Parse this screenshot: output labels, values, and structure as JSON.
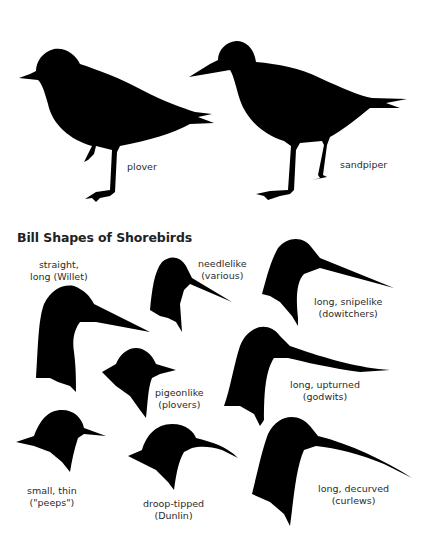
{
  "top_section": {
    "birds": [
      {
        "id": "plover",
        "label": "plover"
      },
      {
        "id": "sandpiper",
        "label": "sandpiper"
      }
    ]
  },
  "bill_section": {
    "title": "Bill Shapes of Shorebirds",
    "bills": [
      {
        "id": "willet",
        "line1": "straight,",
        "line2": "long (Willet)"
      },
      {
        "id": "needlelike",
        "line1": "needlelike",
        "line2": "(various)"
      },
      {
        "id": "snipelike",
        "line1": "long, snipelike",
        "line2": "(dowitchers)"
      },
      {
        "id": "pigeonlike",
        "line1": "pigeonlike",
        "line2": "(plovers)"
      },
      {
        "id": "upturned",
        "line1": "long, upturned",
        "line2": "(godwits)"
      },
      {
        "id": "peeps",
        "line1": "small, thin",
        "line2": "(\"peeps\")"
      },
      {
        "id": "droop",
        "line1": "droop-tipped",
        "line2": "(Dunlin)"
      },
      {
        "id": "decurved",
        "line1": "long, decurved",
        "line2": "(curlews)"
      }
    ]
  },
  "colors": {
    "silhouette": "#000000",
    "background": "#ffffff",
    "text": "#2b2b2b"
  }
}
